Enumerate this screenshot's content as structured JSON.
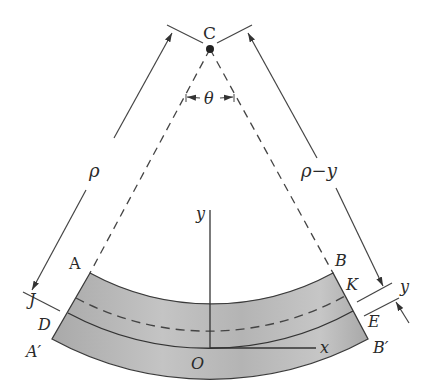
{
  "diagram": {
    "type": "beam-bending-geometry",
    "center_label": "C",
    "angle_label": "θ",
    "radius_label": "ρ",
    "radius_minus_y_label": "ρ−y",
    "y_offset_label": "y",
    "points": {
      "A": "A",
      "B": "B",
      "J": "J",
      "K": "K",
      "D": "D",
      "E": "E",
      "A_prime": "A′",
      "B_prime": "B′",
      "O": "O"
    },
    "axes": {
      "x_label": "x",
      "y_label": "y"
    },
    "colors": {
      "beam_fill": "#b9b9b9",
      "beam_edge": "#3a3a3a",
      "line": "#3a3a3a",
      "background": "#ffffff"
    }
  }
}
